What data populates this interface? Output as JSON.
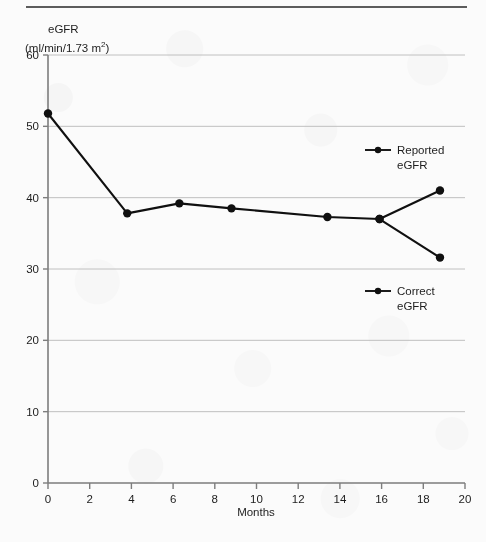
{
  "figure": {
    "background_color": "#fbfbfb",
    "ink_color": "#101010",
    "grid_color": "#b9b9b9",
    "axis_color": "#7d7d7d"
  },
  "axis_labels": {
    "y_title_line1": "eGFR",
    "y_title_line2_pre": "(ml/min/1.73 m",
    "y_title_line2_sup": "2",
    "y_title_line2_post": ")",
    "x_title": "Months"
  },
  "legend": [
    {
      "label_line1": "Reported",
      "label_line2": "eGFR",
      "marker": "line-dot-marker"
    },
    {
      "label_line1": "Correct",
      "label_line2": "eGFR",
      "marker": "line-dot-marker"
    }
  ],
  "chart_data": {
    "type": "line",
    "title": "",
    "xlabel": "Months",
    "ylabel": "eGFR (ml/min/1.73 m2)",
    "xlim": [
      0,
      20
    ],
    "ylim": [
      0,
      60
    ],
    "xticks": [
      0,
      2,
      4,
      6,
      8,
      10,
      12,
      14,
      16,
      18,
      20
    ],
    "yticks": [
      0,
      10,
      20,
      30,
      40,
      50,
      60
    ],
    "grid": "horizontal",
    "legend_position": "right-inside",
    "series": [
      {
        "name": "Reported eGFR",
        "points": [
          {
            "x": 0.0,
            "y": 51.8
          },
          {
            "x": 3.8,
            "y": 37.8
          },
          {
            "x": 6.3,
            "y": 39.2
          },
          {
            "x": 8.8,
            "y": 38.5
          },
          {
            "x": 13.4,
            "y": 37.3
          },
          {
            "x": 15.9,
            "y": 37.0
          },
          {
            "x": 18.8,
            "y": 41.0
          }
        ]
      },
      {
        "name": "Correct eGFR",
        "points": [
          {
            "x": 15.9,
            "y": 37.0
          },
          {
            "x": 18.8,
            "y": 31.6
          }
        ]
      }
    ]
  }
}
